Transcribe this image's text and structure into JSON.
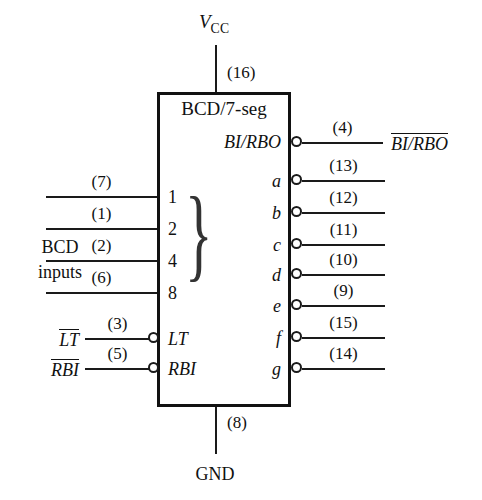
{
  "diagram": {
    "title": "BCD/7-seg",
    "power": {
      "top_label": "V",
      "top_label_sub": "CC",
      "top_pin": "(16)",
      "bottom_label": "GND",
      "bottom_pin": "(8)"
    },
    "inputs_group_label_line1": "BCD",
    "inputs_group_label_line2": "inputs",
    "bcd_inputs": [
      {
        "pin": "(7)",
        "weight": "1"
      },
      {
        "pin": "(1)",
        "weight": "2"
      },
      {
        "pin": "(2)",
        "weight": "4"
      },
      {
        "pin": "(6)",
        "weight": "8"
      }
    ],
    "control_inputs": [
      {
        "pin": "(3)",
        "inner": "LT",
        "external": "LT",
        "overbar": true
      },
      {
        "pin": "(5)",
        "inner": "RBI",
        "external": "RBI",
        "overbar": true
      }
    ],
    "bidirectional": {
      "pin": "(4)",
      "inner": "BI/RBO",
      "external": "BI/RBO",
      "overbar": true
    },
    "segment_outputs": [
      {
        "pin": "(13)",
        "inner": "a"
      },
      {
        "pin": "(12)",
        "inner": "b"
      },
      {
        "pin": "(11)",
        "inner": "c"
      },
      {
        "pin": "(10)",
        "inner": "d"
      },
      {
        "pin": "(9)",
        "inner": "e"
      },
      {
        "pin": "(15)",
        "inner": "f"
      },
      {
        "pin": "(14)",
        "inner": "g"
      }
    ],
    "brace_glyph": "}",
    "colors": {
      "ink": "#111111",
      "wire": "#1a1a1a",
      "background": "#ffffff"
    }
  }
}
